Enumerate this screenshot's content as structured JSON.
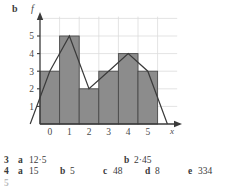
{
  "figure": {
    "part_label": "b",
    "y_axis_label": "f",
    "x_axis_label": "x"
  },
  "chart_data": {
    "type": "bar",
    "title": "",
    "xlabel": "x",
    "ylabel": "f",
    "categories": [
      "0",
      "1",
      "2",
      "3",
      "4",
      "5"
    ],
    "values": [
      3,
      5,
      2,
      3,
      4,
      3
    ],
    "series": [
      {
        "name": "histogram",
        "values": [
          3,
          5,
          2,
          3,
          4,
          3
        ]
      },
      {
        "name": "frequency-polygon",
        "x": [
          -1,
          0,
          1,
          2,
          3,
          4,
          5,
          6
        ],
        "values": [
          0,
          3,
          5,
          2,
          3,
          4,
          3,
          0
        ]
      }
    ],
    "xlim": [
      -1,
      6
    ],
    "ylim": [
      0,
      6
    ],
    "ytick_labels": [
      "1",
      "2",
      "3",
      "4",
      "5"
    ],
    "ytick_values": [
      1,
      2,
      3,
      4,
      5
    ],
    "xtick_labels": [
      "0",
      "1",
      "2",
      "3",
      "4",
      "5"
    ],
    "xtick_values": [
      0,
      1,
      2,
      3,
      4,
      5
    ],
    "grid": true,
    "legend": "none",
    "bar_fill_color": "#8c8c8c",
    "bar_edge_color": "#4a4a4a",
    "polygon_color": "#3a3a3a",
    "grid_color": "#dcdcdc",
    "axis_color": "#3a3a3a"
  },
  "answers": {
    "line3": {
      "number": "3",
      "parts": [
        {
          "key": "a",
          "value": "12·5"
        },
        {
          "key": "b",
          "value": "2·45"
        }
      ]
    },
    "line4": {
      "number": "4",
      "parts": [
        {
          "key": "a",
          "value": "15"
        },
        {
          "key": "b",
          "value": "5"
        },
        {
          "key": "c",
          "value": "48"
        },
        {
          "key": "d",
          "value": "8"
        },
        {
          "key": "e",
          "value": "334"
        }
      ]
    },
    "line5": {
      "number": "5"
    }
  }
}
